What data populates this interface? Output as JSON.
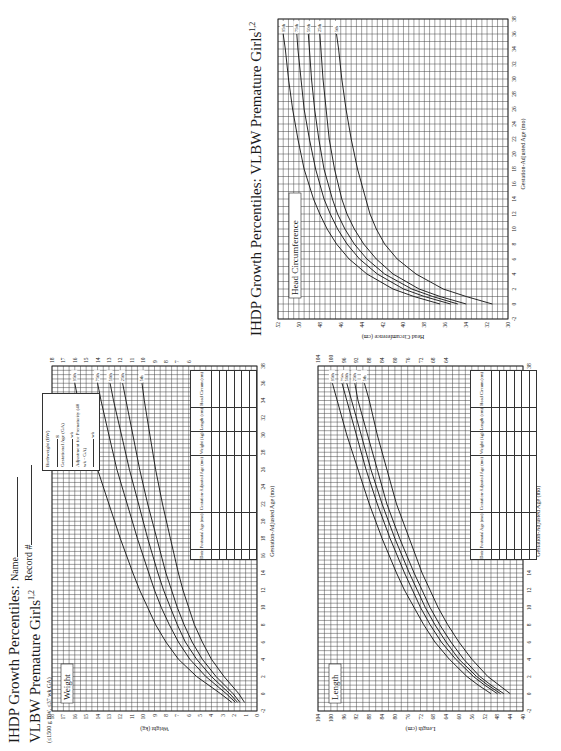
{
  "header": {
    "title_line1": "IHDP Growth Percentiles:",
    "title_line2": "VLBW Premature Girls",
    "title_sup": "1,2",
    "subtitle": "(≤1500 g BW, ≤37 wk GA)",
    "name_label": "Name",
    "record_label": "Record #"
  },
  "legend": {
    "birthweight_label": "Birthweight (BW)",
    "birthweight_unit": "g",
    "ga_label": "Gestational Age (GA)",
    "ga_unit": "wk",
    "adjust_label": "Adjustment for Prematurity (40 wk - GA)",
    "adjust_unit": "wk"
  },
  "table": {
    "headers": [
      "Date",
      "Postnatal Age (mo)",
      "Gestation-Adjusted Age (mo)",
      "Weight (kg)",
      "Length (cm)",
      "Head Circum (cm)"
    ],
    "empty_rows": 6
  },
  "head_circ_page": {
    "title": "IHDP Growth Percentiles: VLBW Premature Girls",
    "title_sup": "1,2"
  },
  "chart_data": [
    {
      "type": "line",
      "title": "Weight",
      "xlabel": "Gestation-Adjusted Age (mo)",
      "ylabel": "Weight (kg)",
      "x_ticks_left": [
        -2,
        0,
        2,
        4,
        6,
        8,
        10,
        12
      ],
      "x_ticks_right": [
        14,
        16,
        18,
        20,
        22,
        24,
        26,
        28,
        30,
        32,
        34,
        36,
        38
      ],
      "y_ticks_left": [
        0,
        1,
        2,
        3,
        4,
        5,
        6,
        7,
        8,
        9,
        10,
        11,
        12,
        13,
        14,
        15,
        16,
        17,
        18
      ],
      "y_ticks_right": [
        6,
        7,
        8,
        9,
        10,
        11,
        12,
        13,
        14,
        15,
        16,
        17,
        18
      ],
      "xlim": [
        -2,
        38
      ],
      "ylim": [
        0,
        18
      ],
      "grid": true,
      "x": [
        -1,
        0,
        2,
        4,
        6,
        8,
        10,
        12,
        14,
        18,
        22,
        26,
        30,
        34,
        36
      ],
      "series": [
        {
          "name": "95th",
          "values": [
            2.2,
            3.2,
            5.3,
            6.9,
            8.0,
            8.9,
            9.6,
            10.3,
            10.9,
            12.0,
            13.0,
            14.0,
            14.9,
            15.7,
            16.0
          ]
        },
        {
          "name": "75th",
          "values": [
            1.9,
            2.7,
            4.5,
            5.9,
            6.9,
            7.7,
            8.4,
            9.0,
            9.5,
            10.5,
            11.4,
            12.3,
            13.0,
            13.7,
            14.0
          ]
        },
        {
          "name": "50th",
          "values": [
            1.7,
            2.4,
            4.0,
            5.3,
            6.3,
            7.0,
            7.6,
            8.2,
            8.7,
            9.6,
            10.4,
            11.2,
            11.9,
            12.6,
            12.9
          ]
        },
        {
          "name": "25th",
          "values": [
            1.5,
            2.1,
            3.6,
            4.8,
            5.7,
            6.4,
            7.0,
            7.5,
            8.0,
            8.8,
            9.6,
            10.3,
            10.9,
            11.5,
            11.8
          ]
        },
        {
          "name": "5th",
          "values": [
            1.1,
            1.6,
            2.9,
            4.0,
            4.8,
            5.5,
            6.0,
            6.5,
            6.9,
            7.6,
            8.3,
            8.9,
            9.4,
            9.9,
            10.1
          ]
        }
      ]
    },
    {
      "type": "line",
      "title": "Length",
      "xlabel": "Gestation-Adjusted Age (mo)",
      "ylabel": "Length (cm)",
      "x_ticks_left": [
        -2,
        0,
        2,
        4,
        6,
        8,
        10,
        12
      ],
      "x_ticks_right": [
        14,
        16,
        18,
        20,
        22,
        24,
        26,
        28,
        30,
        32,
        34,
        36,
        38
      ],
      "y_ticks_left": [
        40,
        44,
        48,
        52,
        56,
        60,
        64,
        68,
        72,
        76,
        80,
        84,
        88,
        92,
        96,
        100,
        104
      ],
      "y_ticks_right": [
        64,
        68,
        72,
        76,
        80,
        84,
        88,
        92,
        96,
        100,
        104
      ],
      "xlim": [
        -2,
        38
      ],
      "ylim": [
        40,
        104
      ],
      "grid": true,
      "x": [
        0,
        1,
        2,
        4,
        6,
        8,
        10,
        12,
        14,
        18,
        22,
        26,
        30,
        34,
        36
      ],
      "series": [
        {
          "name": "95th",
          "values": [
            50,
            54,
            57.5,
            63,
            67.5,
            71,
            74,
            77,
            79.5,
            84,
            88,
            91.5,
            95,
            98,
            99.5
          ]
        },
        {
          "name": "75th",
          "values": [
            48,
            52,
            55.5,
            61,
            65.5,
            69,
            72,
            74.5,
            77,
            81.5,
            85.5,
            89,
            92,
            95,
            96.5
          ]
        },
        {
          "name": "50th",
          "values": [
            47,
            51,
            54.5,
            60,
            64,
            67.5,
            70.5,
            73,
            75.5,
            80,
            84,
            87.5,
            90.5,
            93.5,
            95
          ]
        },
        {
          "name": "25th",
          "values": [
            46,
            50,
            53.5,
            58.5,
            62.5,
            66,
            69,
            71.5,
            74,
            78.5,
            82.5,
            85.5,
            88.5,
            91.5,
            92.5
          ]
        },
        {
          "name": "5th",
          "values": [
            44,
            47.5,
            51,
            56,
            60,
            63.5,
            66.5,
            69,
            71.5,
            75.5,
            79.5,
            82.5,
            85.5,
            88,
            89.5
          ]
        }
      ]
    },
    {
      "type": "line",
      "title": "Head Circumference",
      "xlabel": "Gestation-Adjusted Age (mo)",
      "ylabel": "Head Circumference (cm)",
      "x_ticks": [
        -2,
        0,
        2,
        4,
        6,
        8,
        10,
        12,
        14,
        16,
        18,
        20,
        22,
        24,
        26,
        28,
        30,
        32,
        34,
        36,
        38
      ],
      "y_ticks": [
        30,
        32,
        34,
        36,
        38,
        40,
        42,
        44,
        46,
        48,
        50,
        52
      ],
      "xlim": [
        -2,
        38
      ],
      "ylim": [
        30,
        52
      ],
      "grid": true,
      "x": [
        0,
        1,
        2,
        4,
        6,
        8,
        10,
        12,
        14,
        18,
        22,
        26,
        30,
        34,
        36
      ],
      "series": [
        {
          "name": "95th",
          "values": [
            36.5,
            39,
            41,
            43.5,
            45.2,
            46.4,
            47.3,
            48,
            48.6,
            49.5,
            50.1,
            50.6,
            51,
            51.3,
            51.5
          ]
        },
        {
          "name": "75th",
          "values": [
            35.5,
            38,
            40,
            42.5,
            44.2,
            45.4,
            46.3,
            47,
            47.6,
            48.4,
            49,
            49.5,
            49.8,
            50.1,
            50.2
          ]
        },
        {
          "name": "50th",
          "values": [
            34.8,
            37.2,
            39.2,
            41.8,
            43.5,
            44.7,
            45.6,
            46.3,
            46.8,
            47.6,
            48.1,
            48.5,
            48.8,
            49,
            49.1
          ]
        },
        {
          "name": "25th",
          "values": [
            34,
            36.5,
            38.5,
            41,
            42.6,
            43.8,
            44.7,
            45.4,
            45.9,
            46.6,
            47.1,
            47.4,
            47.7,
            47.9,
            48
          ]
        },
        {
          "name": "5th",
          "values": [
            31.5,
            34,
            36.2,
            38.8,
            40.6,
            41.8,
            42.6,
            43.2,
            43.6,
            44.4,
            45,
            45.5,
            45.9,
            46.2,
            46.4
          ]
        }
      ]
    }
  ]
}
